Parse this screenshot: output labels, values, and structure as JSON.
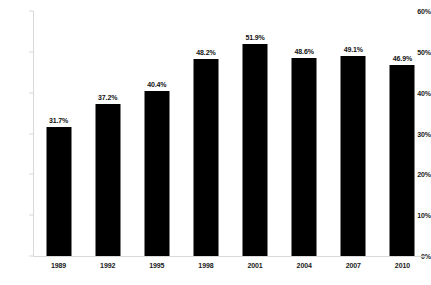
{
  "chart_data": {
    "type": "bar",
    "title": "",
    "subtitle": "",
    "xlabel": "",
    "ylabel": "",
    "categories": [
      "1989",
      "1992",
      "1995",
      "1998",
      "2001",
      "2004",
      "2007",
      "2010"
    ],
    "values": [
      31.7,
      37.2,
      40.4,
      48.2,
      51.9,
      48.6,
      49.1,
      46.9
    ],
    "data_labels": [
      "31.7%",
      "37.2%",
      "40.4%",
      "48.2%",
      "51.9%",
      "48.6%",
      "49.1%",
      "46.9%"
    ],
    "series": [
      {
        "name": "",
        "values": [
          31.7,
          37.2,
          40.4,
          48.2,
          51.9,
          48.6,
          49.1,
          46.9
        ]
      }
    ],
    "ylim": [
      0,
      60
    ],
    "ytick_values": [
      0,
      10,
      20,
      30,
      40,
      50,
      60
    ],
    "ytick_labels": [
      "0%",
      "10%",
      "20%",
      "30%",
      "40%",
      "50%",
      "60%"
    ],
    "grid": false,
    "legend": null,
    "legend_position": "none",
    "bar_color": "#000000",
    "axis_color": "#d9d9d9",
    "text_color": "#1a1a1a",
    "background_color": "#ffffff"
  }
}
